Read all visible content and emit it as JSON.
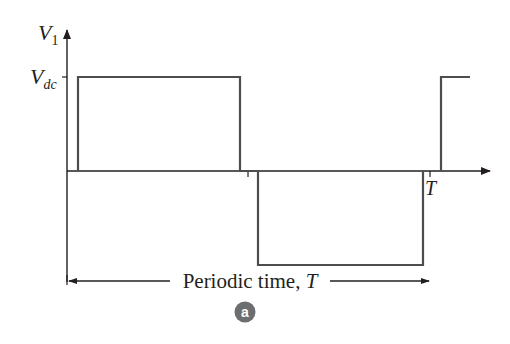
{
  "diagram": {
    "type": "square-wave-waveform",
    "y_axis_label": {
      "main": "V",
      "subscript": "1"
    },
    "level_label": {
      "main": "V",
      "subscript": "dc"
    },
    "period_tick_label": "T",
    "period_annotation": "Periodic time, T",
    "badge": "a",
    "colors": {
      "line": "#4d4d4f",
      "axis": "#231f20",
      "badge": "#6d6e70"
    }
  }
}
